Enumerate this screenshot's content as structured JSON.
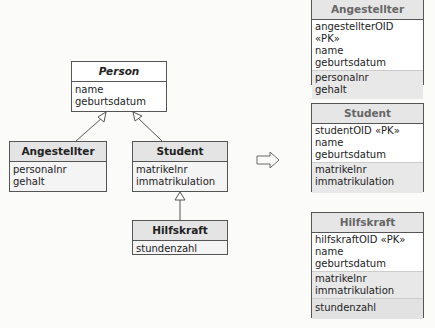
{
  "left": {
    "person": {
      "name": "Person",
      "attributes": [
        "name",
        "geburtsdatum"
      ]
    },
    "angestellter": {
      "name": "Angestellter",
      "attributes": [
        "personalnr",
        "gehalt"
      ]
    },
    "student": {
      "name": "Student",
      "attributes": [
        "matrikelnr",
        "immatrikulation"
      ]
    },
    "hilfskraft": {
      "name": "Hilfskraft",
      "attributes": [
        "stundenzahl"
      ]
    }
  },
  "arrow": {
    "icon": "right-arrow-icon"
  },
  "right": {
    "angestellter": {
      "name": "Angestellter",
      "pk": "angestellterOID «PK»",
      "inherited": [
        "name",
        "geburtsdatum"
      ],
      "own": [
        "personalnr",
        "gehalt"
      ]
    },
    "student": {
      "name": "Student",
      "pk": "studentOID «PK»",
      "inherited": [
        "name",
        "geburtsdatum"
      ],
      "own": [
        "matrikelnr",
        "immatrikulation"
      ]
    },
    "hilfskraft": {
      "name": "Hilfskraft",
      "pk": "hilfskraftOID «PK»",
      "inherited": [
        "name",
        "geburtsdatum"
      ],
      "student": [
        "matrikelnr",
        "immatrikulation"
      ],
      "own": [
        "stundenzahl"
      ]
    }
  }
}
